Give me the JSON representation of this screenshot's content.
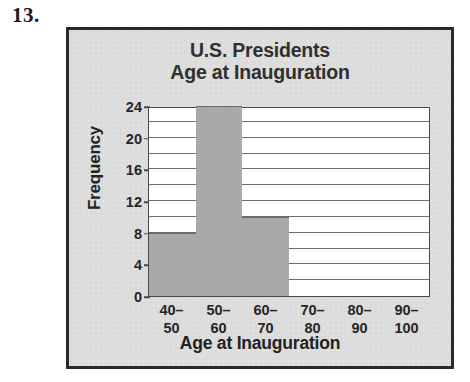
{
  "problem": {
    "number": "13."
  },
  "chart_data": {
    "type": "bar",
    "title_line1": "U.S. Presidents",
    "title_line2": "Age at Inauguration",
    "xlabel": "Age at Inauguration",
    "ylabel": "Frequency",
    "categories": [
      "40–50",
      "50–60",
      "60–70",
      "70–80",
      "80–90",
      "90–100"
    ],
    "category_parts": [
      {
        "lo": "40–",
        "hi": "50"
      },
      {
        "lo": "50–",
        "hi": "60"
      },
      {
        "lo": "60–",
        "hi": "70"
      },
      {
        "lo": "70–",
        "hi": "80"
      },
      {
        "lo": "80–",
        "hi": "90"
      },
      {
        "lo": "90–",
        "hi": "100"
      }
    ],
    "values": [
      8,
      24,
      10,
      0,
      0,
      0
    ],
    "ylim": [
      0,
      24
    ],
    "ytick_labels": [
      "0",
      "4",
      "8",
      "12",
      "16",
      "20",
      "24"
    ],
    "ytick_values": [
      0,
      4,
      8,
      12,
      16,
      20,
      24
    ],
    "gridline_values": [
      2,
      4,
      6,
      8,
      10,
      12,
      14,
      16,
      18,
      20,
      22
    ],
    "grid": true,
    "legend": null,
    "colors": {
      "bar_fill": "#a9a9a9",
      "bar_edge": "#6a6a6a",
      "plot_background": "#ffffff",
      "figure_background": "#dcdcdc",
      "frame_border": "#2a2a2a",
      "title_text": "#2f2f2f",
      "axis_text": "#262626",
      "gridline": "#6d6d6d"
    }
  }
}
